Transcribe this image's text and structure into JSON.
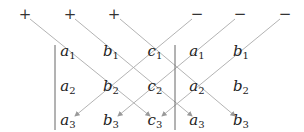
{
  "signs": {
    "plus": [
      "+",
      "+",
      "+"
    ],
    "minus": [
      "−",
      "−",
      "−"
    ]
  },
  "matrix": {
    "rows": [
      [
        {
          "l": "a",
          "s": "1"
        },
        {
          "l": "b",
          "s": "1"
        },
        {
          "l": "c",
          "s": "1"
        },
        {
          "l": "a",
          "s": "1"
        },
        {
          "l": "b",
          "s": "1"
        }
      ],
      [
        {
          "l": "a",
          "s": "2"
        },
        {
          "l": "b",
          "s": "2"
        },
        {
          "l": "c",
          "s": "2"
        },
        {
          "l": "a",
          "s": "2"
        },
        {
          "l": "b",
          "s": "2"
        }
      ],
      [
        {
          "l": "a",
          "s": "3"
        },
        {
          "l": "b",
          "s": "3"
        },
        {
          "l": "c",
          "s": "3"
        },
        {
          "l": "a",
          "s": "3"
        },
        {
          "l": "b",
          "s": "3"
        }
      ]
    ],
    "repeated_columns": [
      "a",
      "b"
    ]
  },
  "colors": {
    "line": "#999999",
    "text": "#222222"
  }
}
